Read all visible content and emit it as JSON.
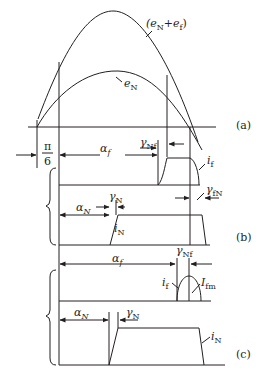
{
  "figure": {
    "panel_labels": {
      "a": "(a)",
      "b": "(b)",
      "c": "(c)"
    },
    "curves": {
      "sum": {
        "base": "(e",
        "sub1": "N",
        "plus": "+e",
        "sub2": "f",
        "close": ")"
      },
      "eN": {
        "base": "e",
        "sub": "N"
      }
    },
    "angles": {
      "pi6_num": "π",
      "pi6_den": "6",
      "alpha_f": {
        "base": "α",
        "sub": "f"
      },
      "alpha_N": {
        "base": "α",
        "sub": "N"
      },
      "gamma_Nf": {
        "base": "γ",
        "sub": "Nf"
      },
      "gamma_N": {
        "base": "γ",
        "sub": "N"
      },
      "gamma_fN": {
        "base": "γ",
        "sub": "fN"
      }
    },
    "currents": {
      "i_f": {
        "base": "i",
        "sub": "f"
      },
      "i_N": {
        "base": "i",
        "sub": "N"
      },
      "I_fm": {
        "base": "I",
        "sub": "fm"
      }
    },
    "colors": {
      "line": "#231f20",
      "background": "#ffffff"
    }
  }
}
